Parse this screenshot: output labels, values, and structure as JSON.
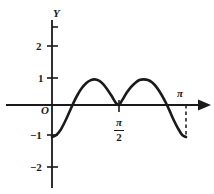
{
  "figure": {
    "title": "",
    "background_color": "#ffffff",
    "ink_color": "#1a1a1a",
    "width": 214,
    "height": 194
  },
  "axes": {
    "y_axis_label": "Y",
    "origin_label": "O",
    "x_axis_end_label": "π",
    "y_tick_labels": [
      "2",
      "1",
      "−1",
      "−2"
    ],
    "x_tick_labels": [
      {
        "numerator": "π",
        "denominator": "2",
        "display": "π/2"
      }
    ]
  },
  "chart_data": {
    "type": "line",
    "title": "",
    "xlabel": "",
    "ylabel": "Y",
    "xlim": [
      0,
      3.4558
    ],
    "ylim": [
      -2.6,
      2.9
    ],
    "grid": false,
    "legend": null,
    "x_ticks": [
      1.5708
    ],
    "x_tick_labels": [
      "π/2"
    ],
    "y_ticks": [
      -2,
      -1,
      1,
      2
    ],
    "y_tick_labels": [
      "−2",
      "−1",
      "1",
      "2"
    ],
    "annotations": [
      {
        "text": "π",
        "x": 3.1416,
        "y": 0.25,
        "kind": "axis-point-label"
      },
      {
        "text": "O",
        "x": -0.12,
        "y": -0.28,
        "kind": "origin-label"
      }
    ],
    "dashed_guides": [
      {
        "x": 3.1416,
        "y_from": 0,
        "y_to": -1,
        "style": "dashed"
      }
    ],
    "series": [
      {
        "name": "y = -cos(2x) scaled",
        "style": "solid",
        "line_width": 2.6,
        "color": "#1a1a1a",
        "x": [
          0,
          0.1,
          0.2,
          0.3,
          0.4,
          0.5,
          0.6,
          0.7,
          0.8,
          0.9,
          1.0,
          1.1,
          1.2,
          1.3,
          1.4,
          1.5,
          1.5708,
          1.65,
          1.75,
          1.85,
          1.95,
          2.05,
          2.15,
          2.25,
          2.35,
          2.45,
          2.55,
          2.65,
          2.75,
          2.85,
          2.95,
          3.05,
          3.1416
        ],
        "y": [
          -1.0,
          -0.94,
          -0.78,
          -0.53,
          -0.24,
          0.06,
          0.32,
          0.53,
          0.68,
          0.77,
          0.8,
          0.76,
          0.65,
          0.48,
          0.28,
          0.06,
          0.0,
          0.16,
          0.38,
          0.56,
          0.69,
          0.78,
          0.8,
          0.78,
          0.7,
          0.56,
          0.36,
          0.12,
          -0.16,
          -0.46,
          -0.72,
          -0.93,
          -1.0
        ]
      }
    ],
    "key_points": [
      {
        "label": "start",
        "x": 0,
        "y": -1
      },
      {
        "label": "first-peak",
        "x": 1.0,
        "y": 0.8
      },
      {
        "label": "zero-at-pi-over-2",
        "x": 1.5708,
        "y": 0
      },
      {
        "label": "second-peak",
        "x": 2.15,
        "y": 0.8
      },
      {
        "label": "end-minimum-at-pi",
        "x": 3.1416,
        "y": -1
      }
    ]
  }
}
